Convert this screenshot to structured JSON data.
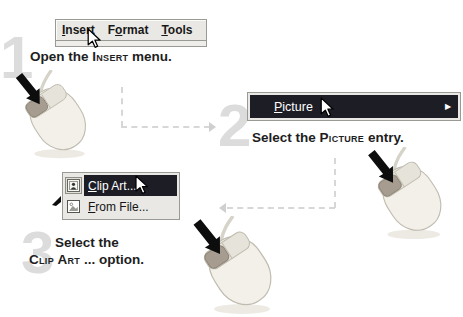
{
  "colors": {
    "menu_highlight": "#1d1d26",
    "menu_background": "#e9e8e4",
    "numeral": "#dcdcdc",
    "dashed_line": "#d7d7d7"
  },
  "menubar": {
    "items": [
      {
        "pre": "",
        "accel": "I",
        "post": "nsert"
      },
      {
        "pre": "F",
        "accel": "o",
        "post": "rmat"
      },
      {
        "pre": "",
        "accel": "T",
        "post": "ools"
      }
    ]
  },
  "picture_menu": {
    "accel": "P",
    "post": "icture",
    "submenu_arrow": "▶"
  },
  "clipart_menu": {
    "items": [
      {
        "accel": "C",
        "post": "lip Art...",
        "icon": "clip-art-gallery-icon",
        "highlighted": true
      },
      {
        "accel": "F",
        "post": "rom File...",
        "icon": "picture-from-file-icon",
        "highlighted": false
      }
    ]
  },
  "steps": [
    {
      "number": "1",
      "pre": "Open the ",
      "keyword": "Insert",
      "post": " menu."
    },
    {
      "number": "2",
      "pre": "Select the ",
      "keyword": "Picture",
      "post": " entry."
    },
    {
      "number": "3",
      "line1": "Select the",
      "keyword": "Clip Art",
      "post": " ... option."
    }
  ]
}
